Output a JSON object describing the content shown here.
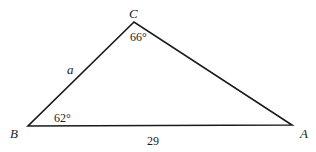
{
  "diagram": {
    "type": "triangle",
    "stroke_color": "#1a1a1a",
    "background": "#ffffff",
    "vertices": [
      {
        "name": "A",
        "x": 292,
        "y": 125,
        "label": "A",
        "label_x": 300,
        "label_y": 138
      },
      {
        "name": "B",
        "x": 28,
        "y": 126,
        "label": "B",
        "label_x": 10,
        "label_y": 138
      },
      {
        "name": "C",
        "x": 134,
        "y": 22,
        "label": "C",
        "label_x": 129,
        "label_y": 18
      }
    ],
    "angles": [
      {
        "vertex": "C",
        "label": "66°",
        "x": 130,
        "y": 41
      },
      {
        "vertex": "B",
        "label": "62°",
        "x": 54,
        "y": 122
      }
    ],
    "sides": [
      {
        "between": "B-C",
        "label": "a",
        "italic": true,
        "x": 67,
        "y": 74
      },
      {
        "between": "B-A",
        "label": "29",
        "italic": false,
        "x": 147,
        "y": 145
      }
    ]
  }
}
